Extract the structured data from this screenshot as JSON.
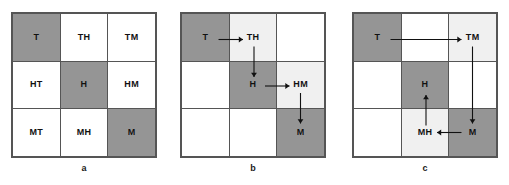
{
  "figure": {
    "colors": {
      "gray_cell": "#959595",
      "light_cell": "#f0f0f0",
      "white_cell": "#ffffff",
      "grid_line": "#555555",
      "arrow": "#111111",
      "text": "#111111"
    },
    "grid": {
      "rows": 3,
      "cols": 3
    }
  },
  "panels": [
    {
      "id": "a",
      "caption": "a",
      "cells": [
        {
          "label": "T",
          "shade": "gray"
        },
        {
          "label": "TH",
          "shade": "white"
        },
        {
          "label": "TM",
          "shade": "white"
        },
        {
          "label": "HT",
          "shade": "white"
        },
        {
          "label": "H",
          "shade": "gray"
        },
        {
          "label": "HM",
          "shade": "white"
        },
        {
          "label": "MT",
          "shade": "white"
        },
        {
          "label": "MH",
          "shade": "white"
        },
        {
          "label": "M",
          "shade": "gray"
        }
      ],
      "arrows": []
    },
    {
      "id": "b",
      "caption": "b",
      "cells": [
        {
          "label": "T",
          "shade": "gray"
        },
        {
          "label": "TH",
          "shade": "light"
        },
        {
          "label": "",
          "shade": "white"
        },
        {
          "label": "",
          "shade": "white"
        },
        {
          "label": "H",
          "shade": "gray"
        },
        {
          "label": "HM",
          "shade": "light"
        },
        {
          "label": "",
          "shade": "white"
        },
        {
          "label": "",
          "shade": "white"
        },
        {
          "label": "M",
          "shade": "gray"
        }
      ],
      "arrows": [
        {
          "from": "T",
          "to": "TH",
          "direction": "right"
        },
        {
          "from": "TH",
          "to": "H",
          "direction": "down"
        },
        {
          "from": "H",
          "to": "HM",
          "direction": "right"
        },
        {
          "from": "HM",
          "to": "M",
          "direction": "down"
        }
      ]
    },
    {
      "id": "c",
      "caption": "c",
      "cells": [
        {
          "label": "T",
          "shade": "gray"
        },
        {
          "label": "",
          "shade": "white"
        },
        {
          "label": "TM",
          "shade": "light"
        },
        {
          "label": "",
          "shade": "white"
        },
        {
          "label": "H",
          "shade": "gray"
        },
        {
          "label": "",
          "shade": "white"
        },
        {
          "label": "",
          "shade": "white"
        },
        {
          "label": "MH",
          "shade": "light"
        },
        {
          "label": "M",
          "shade": "gray"
        }
      ],
      "arrows": [
        {
          "from": "T",
          "to": "TM",
          "direction": "right"
        },
        {
          "from": "TM",
          "to": "M",
          "direction": "down"
        },
        {
          "from": "M",
          "to": "MH",
          "direction": "left"
        },
        {
          "from": "MH",
          "to": "H",
          "direction": "up"
        }
      ]
    }
  ]
}
